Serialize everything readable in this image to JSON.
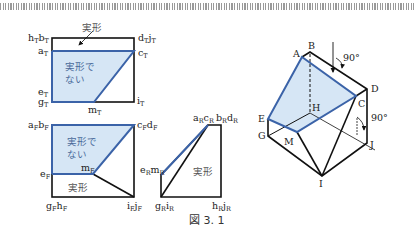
{
  "figure": {
    "caption": "図 3. 1",
    "colors": {
      "edge": "#111111",
      "blue_edge": "#3b63a8",
      "fill": "#d6e6f5",
      "text": "#222222"
    },
    "top_view": {
      "labels": {
        "hb": "h",
        "hb_sub": "T",
        "b": "b",
        "b_sub": "T",
        "dj": "d",
        "dj_sub": "T",
        "j": "j",
        "j_sub": "T",
        "a": "a",
        "a_sub": "T",
        "c": "c",
        "c_sub": "T",
        "e": "e",
        "e_sub": "T",
        "g": "g",
        "g_sub": "T",
        "m": "m",
        "m_sub": "T",
        "i": "i",
        "i_sub": "T"
      },
      "true_shape": "実形",
      "not_true_shape_1": "実形で",
      "not_true_shape_2": "ない"
    },
    "front_view": {
      "labels": {
        "a": "a",
        "a_sub": "F",
        "b": "b",
        "b_sub": "F",
        "c": "c",
        "c_sub": "F",
        "d": "d",
        "d_sub": "F",
        "e": "e",
        "e_sub": "F",
        "m": "m",
        "m_sub": "F",
        "g": "g",
        "g_sub": "F",
        "h": "h",
        "h_sub": "F",
        "i": "i",
        "i_sub": "F",
        "j": "j",
        "j_sub": "F"
      },
      "not_true_shape_1": "実形で",
      "not_true_shape_2": "ない",
      "true_shape": "実形"
    },
    "side_view": {
      "labels": {
        "a": "a",
        "a_sub": "R",
        "c": "c",
        "c_sub": "R",
        "b": "b",
        "b_sub": "R",
        "d": "d",
        "d_sub": "R",
        "e": "e",
        "e_sub": "R",
        "m": "m",
        "m_sub": "R",
        "g": "g",
        "g_sub": "R",
        "i": "i",
        "i_sub": "R",
        "h": "h",
        "h_sub": "R",
        "j": "j",
        "j_sub": "R"
      },
      "true_shape": "実形"
    },
    "isometric": {
      "vertices": [
        "A",
        "B",
        "C",
        "D",
        "E",
        "G",
        "H",
        "I",
        "J",
        "M"
      ],
      "angle_top": "90°",
      "angle_right": "90°"
    }
  }
}
